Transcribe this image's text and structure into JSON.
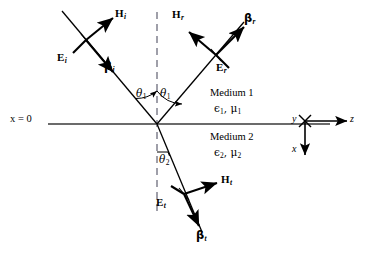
{
  "figure": {
    "colors": {
      "line": "#000000",
      "dashed": "#7f7f8c",
      "interface": "#3a3a3a",
      "background": "#ffffff"
    }
  },
  "interface": {
    "x_zero_label": "x = 0",
    "normal_line_style": "dashed"
  },
  "media": {
    "upper": {
      "name": "Medium 1",
      "constants": "ϵ₁ , μ₁",
      "epsilon": "ϵ",
      "epsilon_sub": "1",
      "mu": "μ",
      "mu_sub": "1"
    },
    "lower": {
      "name": "Medium 2",
      "constants": "ϵ₂ , μ₂",
      "epsilon": "ϵ",
      "epsilon_sub": "2",
      "mu": "μ",
      "mu_sub": "2"
    }
  },
  "angles": [
    {
      "id": "theta-1-incident",
      "symbol": "θ",
      "sub": "1"
    },
    {
      "id": "theta-1-reflected",
      "symbol": "θ",
      "sub": "1"
    },
    {
      "id": "theta-2-transmitted",
      "symbol": "θ",
      "sub": "2"
    }
  ],
  "waves": {
    "incident": {
      "id": "incident",
      "E": {
        "symbol": "E",
        "sub": "i"
      },
      "H": {
        "symbol": "H",
        "sub": "i"
      },
      "beta": {
        "symbol": "β",
        "sub": "i"
      }
    },
    "reflected": {
      "id": "reflected",
      "E": {
        "symbol": "E",
        "sub": "r"
      },
      "H": {
        "symbol": "H",
        "sub": "r"
      },
      "beta": {
        "symbol": "β",
        "sub": "r"
      }
    },
    "transmitted": {
      "id": "transmitted",
      "E": {
        "symbol": "E",
        "sub": "t"
      },
      "H": {
        "symbol": "H",
        "sub": "t"
      },
      "beta": {
        "symbol": "β",
        "sub": "t"
      }
    }
  },
  "axes": {
    "x": "x",
    "y": "y",
    "z": "z"
  }
}
